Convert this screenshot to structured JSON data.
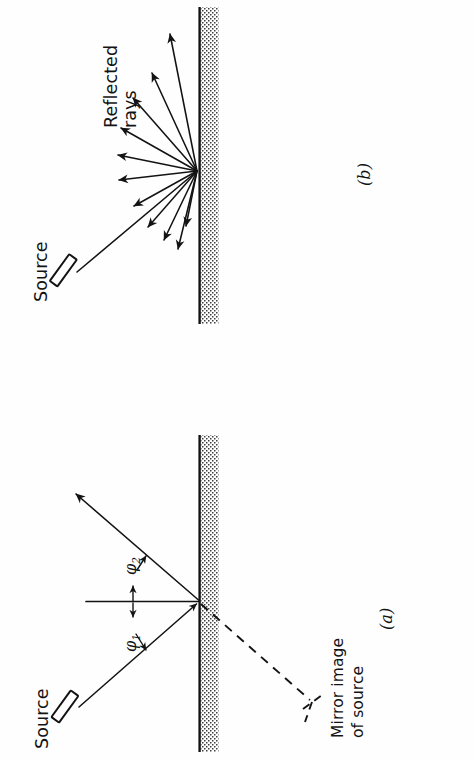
{
  "figure": {
    "orientation": "rotated-90-ccw",
    "background_color": "#fefefe",
    "ink_color": "#131313",
    "panels": [
      {
        "id": "b",
        "caption": "(b)",
        "kind": "diffuse-reflection",
        "labels": {
          "source": "Source",
          "rays": "Reflected\nrays"
        },
        "ray_count": 11
      },
      {
        "id": "a",
        "caption": "(a)",
        "kind": "specular-reflection",
        "labels": {
          "source": "Source",
          "mirror_image_line1": "Mirror image",
          "mirror_image_line2": "of source",
          "angle_incident": "φ",
          "angle_incident_sub": "1",
          "angle_reflected": "φ",
          "angle_reflected_sub": "2"
        }
      }
    ],
    "wall": {
      "name": "mirror-surface",
      "fill_pattern": "stipple",
      "edge_color": "#131313",
      "stipple_color": "#4a4a4a"
    }
  }
}
